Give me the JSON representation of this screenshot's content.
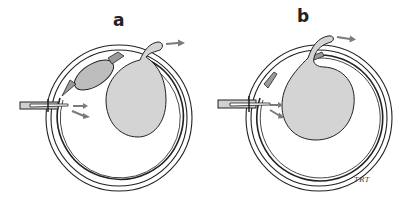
{
  "figure": {
    "panels": [
      {
        "label": "a",
        "description": "eye cross-section with cannula, displaced lens and drained bleb"
      },
      {
        "label": "b",
        "description": "eye cross-section with cannula and drained bleb, lens absent"
      }
    ],
    "signature": "TRT",
    "colors": {
      "line": "#222222",
      "fill_gray": "#d4d4d4",
      "lens_gray": "#bdbdbd",
      "arrow_gray": "#7a7a7a",
      "background": "#ffffff"
    }
  }
}
